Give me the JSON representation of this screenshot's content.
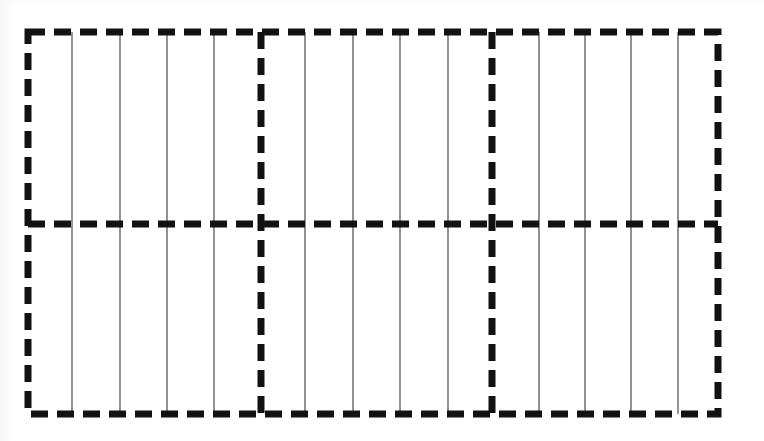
{
  "figure": {
    "title": "Dashed rectangular grid diagram",
    "background_color": "#ffffff",
    "dashed_line_color": "#121212",
    "solid_line_color": "#3a3a3a",
    "canvas": {
      "width": 764,
      "height": 441
    },
    "outer_rectangle": {
      "name": "outer-dashed-border",
      "left": 28,
      "top": 32,
      "right": 718,
      "bottom": 414,
      "stroke_width": 7,
      "dash_length": 17,
      "gap_length": 9
    },
    "vertical_dashed_dividers": [
      {
        "name": "vertical-divider-1",
        "x": 261
      },
      {
        "name": "vertical-divider-2",
        "x": 492
      }
    ],
    "horizontal_dashed_dividers": [
      {
        "name": "horizontal-divider-1",
        "y": 224
      }
    ],
    "sections": [
      {
        "name": "section-left",
        "x_start": 28,
        "x_end": 261,
        "solid_lines_x": [
          72,
          120,
          167,
          214
        ]
      },
      {
        "name": "section-middle",
        "x_start": 261,
        "x_end": 492,
        "solid_lines_x": [
          305,
          353,
          400,
          448
        ]
      },
      {
        "name": "section-right",
        "x_start": 492,
        "x_end": 718,
        "solid_lines_x": [
          539,
          585,
          631,
          678
        ]
      }
    ],
    "counts": {
      "columns": 3,
      "rows": 2,
      "solid_lines_per_section": 4,
      "total_solid_lines": 12
    }
  }
}
